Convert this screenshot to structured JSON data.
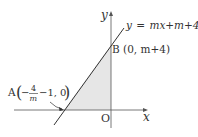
{
  "diagram": {
    "type": "coordinate-plane",
    "axes": {
      "x_label": "x",
      "y_label": "y",
      "origin_label": "O"
    },
    "line": {
      "equation_lhs": "y",
      "equation_eq": "=",
      "equation_rhs": "mx+m+4",
      "equation_full": "y = mx + m + 4"
    },
    "points": [
      {
        "name": "A",
        "label": "A(−4/m − 1, 0)",
        "letter": "A",
        "fraction_numerator": "4",
        "fraction_denominator": "m",
        "neg": "−",
        "rest": "−1, 0"
      },
      {
        "name": "B",
        "label": "B(0, m+4)",
        "letter": "B",
        "coords": "(0, m+4)"
      }
    ],
    "shaded_region": "triangle AOB",
    "colors": {
      "shade": "#e6e6e6",
      "line": "#333333",
      "axis": "#555555"
    }
  }
}
